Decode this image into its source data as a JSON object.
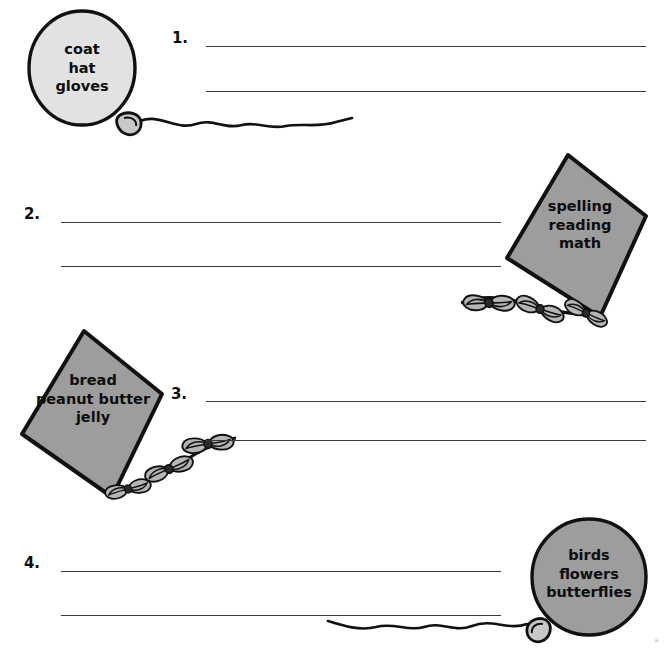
{
  "worksheet": {
    "background_color": "#ffffff",
    "ink_color": "#0d0d0d",
    "line_color": "#3a3a3a",
    "balloon_fill_light": "#e2e2e2",
    "shape_fill_gray": "#9d9d9d",
    "tail_fill_gray": "#b5b5b5"
  },
  "items": [
    {
      "number": "1.",
      "shape_kind": "balloon",
      "shape_text": "coat\nhat\ngloves",
      "words": [
        "coat",
        "hat",
        "gloves"
      ],
      "shape_side": "left",
      "lines": 2
    },
    {
      "number": "2.",
      "shape_kind": "kite",
      "shape_text": "spelling\nreading\nmath",
      "words": [
        "spelling",
        "reading",
        "math"
      ],
      "shape_side": "right",
      "lines": 2
    },
    {
      "number": "3.",
      "shape_kind": "kite",
      "shape_text": "bread\npeanut butter\njelly",
      "words": [
        "bread",
        "peanut butter",
        "jelly"
      ],
      "shape_side": "left",
      "lines": 2
    },
    {
      "number": "4.",
      "shape_kind": "balloon",
      "shape_text": "birds\nflowers\nbutterflies",
      "words": [
        "birds",
        "flowers",
        "butterflies"
      ],
      "shape_side": "right",
      "lines": 2
    }
  ],
  "corner": {
    "mark": "≡"
  },
  "icons": {
    "balloon": "balloon-icon",
    "kite": "kite-icon",
    "string": "balloon-string-icon",
    "tail": "kite-tail-icon",
    "knot": "balloon-knot-icon",
    "bow": "ribbon-bow-icon"
  }
}
